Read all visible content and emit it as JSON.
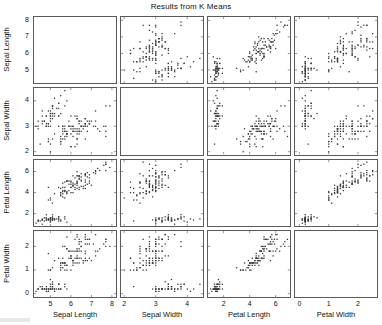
{
  "chart_data": {
    "type": "scatter",
    "title": "Results from K Means",
    "layout": "scatter-plot-matrix",
    "matrix_size": 4,
    "grid": false,
    "legend": "none",
    "diagonal_cells_empty": true,
    "variables": [
      {
        "name": "Sepal Length",
        "axis_label": "Sepal Length",
        "ticks": [
          5,
          6,
          7,
          8
        ],
        "tick_labels": [
          "5",
          "6",
          "7",
          "8"
        ],
        "lim": [
          4.2,
          8.2
        ]
      },
      {
        "name": "Sepal Width",
        "axis_label": "Sepal Width",
        "ticks": [
          2,
          3,
          4
        ],
        "tick_labels": [
          "2",
          "3",
          "4"
        ],
        "lim": [
          1.9,
          4.5
        ]
      },
      {
        "name": "Petal Length",
        "axis_label": "Petal Length",
        "ticks": [
          2,
          4,
          6
        ],
        "tick_labels": [
          "2",
          "4",
          "6"
        ],
        "lim": [
          0.8,
          7.1
        ]
      },
      {
        "name": "Petal Width",
        "axis_label": "Petal Width",
        "ticks": [
          0,
          1,
          2
        ],
        "tick_labels": [
          "0",
          "1",
          "2"
        ],
        "lim": [
          -0.15,
          2.65
        ]
      }
    ],
    "point_color": "#3b3b3b",
    "marker": "dot",
    "n_points": 150,
    "points": [
      [
        5.1,
        3.5,
        1.4,
        0.2
      ],
      [
        4.9,
        3.0,
        1.4,
        0.2
      ],
      [
        4.7,
        3.2,
        1.3,
        0.2
      ],
      [
        4.6,
        3.1,
        1.5,
        0.2
      ],
      [
        5.0,
        3.6,
        1.4,
        0.2
      ],
      [
        5.4,
        3.9,
        1.7,
        0.4
      ],
      [
        4.6,
        3.4,
        1.4,
        0.3
      ],
      [
        5.0,
        3.4,
        1.5,
        0.2
      ],
      [
        4.4,
        2.9,
        1.4,
        0.2
      ],
      [
        4.9,
        3.1,
        1.5,
        0.1
      ],
      [
        5.4,
        3.7,
        1.5,
        0.2
      ],
      [
        4.8,
        3.4,
        1.6,
        0.2
      ],
      [
        4.8,
        3.0,
        1.4,
        0.1
      ],
      [
        4.3,
        3.0,
        1.1,
        0.1
      ],
      [
        5.8,
        4.0,
        1.2,
        0.2
      ],
      [
        5.7,
        4.4,
        1.5,
        0.4
      ],
      [
        5.4,
        3.9,
        1.3,
        0.4
      ],
      [
        5.1,
        3.5,
        1.4,
        0.3
      ],
      [
        5.7,
        3.8,
        1.7,
        0.3
      ],
      [
        5.1,
        3.8,
        1.5,
        0.3
      ],
      [
        5.4,
        3.4,
        1.7,
        0.2
      ],
      [
        5.1,
        3.7,
        1.5,
        0.4
      ],
      [
        4.6,
        3.6,
        1.0,
        0.2
      ],
      [
        5.1,
        3.3,
        1.7,
        0.5
      ],
      [
        4.8,
        3.4,
        1.9,
        0.2
      ],
      [
        5.0,
        3.0,
        1.6,
        0.2
      ],
      [
        5.0,
        3.4,
        1.6,
        0.4
      ],
      [
        5.2,
        3.5,
        1.5,
        0.2
      ],
      [
        5.2,
        3.4,
        1.4,
        0.2
      ],
      [
        4.7,
        3.2,
        1.6,
        0.2
      ],
      [
        4.8,
        3.1,
        1.6,
        0.2
      ],
      [
        5.4,
        3.4,
        1.5,
        0.4
      ],
      [
        5.2,
        4.1,
        1.5,
        0.1
      ],
      [
        5.5,
        4.2,
        1.4,
        0.2
      ],
      [
        4.9,
        3.1,
        1.5,
        0.2
      ],
      [
        5.0,
        3.2,
        1.2,
        0.2
      ],
      [
        5.5,
        3.5,
        1.3,
        0.2
      ],
      [
        4.9,
        3.6,
        1.4,
        0.1
      ],
      [
        4.4,
        3.0,
        1.3,
        0.2
      ],
      [
        5.1,
        3.4,
        1.5,
        0.2
      ],
      [
        5.0,
        3.5,
        1.3,
        0.3
      ],
      [
        4.5,
        2.3,
        1.3,
        0.3
      ],
      [
        4.4,
        3.2,
        1.3,
        0.2
      ],
      [
        5.0,
        3.5,
        1.6,
        0.6
      ],
      [
        5.1,
        3.8,
        1.9,
        0.4
      ],
      [
        4.8,
        3.0,
        1.4,
        0.3
      ],
      [
        5.1,
        3.8,
        1.6,
        0.2
      ],
      [
        4.6,
        3.2,
        1.4,
        0.2
      ],
      [
        5.3,
        3.7,
        1.5,
        0.2
      ],
      [
        5.0,
        3.3,
        1.4,
        0.2
      ],
      [
        7.0,
        3.2,
        4.7,
        1.4
      ],
      [
        6.4,
        3.2,
        4.5,
        1.5
      ],
      [
        6.9,
        3.1,
        4.9,
        1.5
      ],
      [
        5.5,
        2.3,
        4.0,
        1.3
      ],
      [
        6.5,
        2.8,
        4.6,
        1.5
      ],
      [
        5.7,
        2.8,
        4.5,
        1.3
      ],
      [
        6.3,
        3.3,
        4.7,
        1.6
      ],
      [
        4.9,
        2.4,
        3.3,
        1.0
      ],
      [
        6.6,
        2.9,
        4.6,
        1.3
      ],
      [
        5.2,
        2.7,
        3.9,
        1.4
      ],
      [
        5.0,
        2.0,
        3.5,
        1.0
      ],
      [
        5.9,
        3.0,
        4.2,
        1.5
      ],
      [
        6.0,
        2.2,
        4.0,
        1.0
      ],
      [
        6.1,
        2.9,
        4.7,
        1.4
      ],
      [
        5.6,
        2.9,
        3.6,
        1.3
      ],
      [
        6.7,
        3.1,
        4.4,
        1.4
      ],
      [
        5.6,
        3.0,
        4.5,
        1.5
      ],
      [
        5.8,
        2.7,
        4.1,
        1.0
      ],
      [
        6.2,
        2.2,
        4.5,
        1.5
      ],
      [
        5.6,
        2.5,
        3.9,
        1.1
      ],
      [
        5.9,
        3.2,
        4.8,
        1.8
      ],
      [
        6.1,
        2.8,
        4.0,
        1.3
      ],
      [
        6.3,
        2.5,
        4.9,
        1.5
      ],
      [
        6.1,
        2.8,
        4.7,
        1.2
      ],
      [
        6.4,
        2.9,
        4.3,
        1.3
      ],
      [
        6.6,
        3.0,
        4.4,
        1.4
      ],
      [
        6.8,
        2.8,
        4.8,
        1.4
      ],
      [
        6.7,
        3.0,
        5.0,
        1.7
      ],
      [
        6.0,
        2.9,
        4.5,
        1.5
      ],
      [
        5.7,
        2.6,
        3.5,
        1.0
      ],
      [
        5.5,
        2.4,
        3.8,
        1.1
      ],
      [
        5.5,
        2.4,
        3.7,
        1.0
      ],
      [
        5.8,
        2.7,
        3.9,
        1.2
      ],
      [
        6.0,
        2.7,
        5.1,
        1.6
      ],
      [
        5.4,
        3.0,
        4.5,
        1.5
      ],
      [
        6.0,
        3.4,
        4.5,
        1.6
      ],
      [
        6.7,
        3.1,
        4.7,
        1.5
      ],
      [
        6.3,
        2.3,
        4.4,
        1.3
      ],
      [
        5.6,
        3.0,
        4.1,
        1.3
      ],
      [
        5.5,
        2.5,
        4.0,
        1.3
      ],
      [
        5.5,
        2.6,
        4.4,
        1.2
      ],
      [
        6.1,
        3.0,
        4.6,
        1.4
      ],
      [
        5.8,
        2.6,
        4.0,
        1.2
      ],
      [
        5.0,
        2.3,
        3.3,
        1.0
      ],
      [
        5.6,
        2.7,
        4.2,
        1.3
      ],
      [
        5.7,
        3.0,
        4.2,
        1.2
      ],
      [
        5.7,
        2.9,
        4.2,
        1.3
      ],
      [
        6.2,
        2.9,
        4.3,
        1.3
      ],
      [
        5.1,
        2.5,
        3.0,
        1.1
      ],
      [
        5.7,
        2.8,
        4.1,
        1.3
      ],
      [
        6.3,
        3.3,
        6.0,
        2.5
      ],
      [
        5.8,
        2.7,
        5.1,
        1.9
      ],
      [
        7.1,
        3.0,
        5.9,
        2.1
      ],
      [
        6.3,
        2.9,
        5.6,
        1.8
      ],
      [
        6.5,
        3.0,
        5.8,
        2.2
      ],
      [
        7.6,
        3.0,
        6.6,
        2.1
      ],
      [
        4.9,
        2.5,
        4.5,
        1.7
      ],
      [
        7.3,
        2.9,
        6.3,
        1.8
      ],
      [
        6.7,
        2.5,
        5.8,
        1.8
      ],
      [
        7.2,
        3.6,
        6.1,
        2.5
      ],
      [
        6.5,
        3.2,
        5.1,
        2.0
      ],
      [
        6.4,
        2.7,
        5.3,
        1.9
      ],
      [
        6.8,
        3.0,
        5.5,
        2.1
      ],
      [
        5.7,
        2.5,
        5.0,
        2.0
      ],
      [
        5.8,
        2.8,
        5.1,
        2.4
      ],
      [
        6.4,
        3.2,
        5.3,
        2.3
      ],
      [
        6.5,
        3.0,
        5.5,
        1.8
      ],
      [
        7.7,
        3.8,
        6.7,
        2.2
      ],
      [
        7.7,
        2.6,
        6.9,
        2.3
      ],
      [
        6.0,
        2.2,
        5.0,
        1.5
      ],
      [
        6.9,
        3.2,
        5.7,
        2.3
      ],
      [
        5.6,
        2.8,
        4.9,
        2.0
      ],
      [
        7.7,
        2.8,
        6.7,
        2.0
      ],
      [
        6.3,
        2.7,
        4.9,
        1.8
      ],
      [
        6.7,
        3.3,
        5.7,
        2.1
      ],
      [
        7.2,
        3.2,
        6.0,
        1.8
      ],
      [
        6.2,
        2.8,
        4.8,
        1.8
      ],
      [
        6.1,
        3.0,
        4.9,
        1.8
      ],
      [
        6.4,
        2.8,
        5.6,
        2.1
      ],
      [
        7.2,
        3.0,
        5.8,
        1.6
      ],
      [
        7.4,
        2.8,
        6.1,
        1.9
      ],
      [
        7.9,
        3.8,
        6.4,
        2.0
      ],
      [
        6.4,
        2.8,
        5.6,
        2.2
      ],
      [
        6.3,
        2.8,
        5.1,
        1.5
      ],
      [
        6.1,
        2.6,
        5.6,
        1.4
      ],
      [
        7.7,
        3.0,
        6.1,
        2.3
      ],
      [
        6.3,
        3.4,
        5.6,
        2.4
      ],
      [
        6.4,
        3.1,
        5.5,
        1.8
      ],
      [
        6.0,
        3.0,
        4.8,
        1.8
      ],
      [
        6.9,
        3.1,
        5.4,
        2.1
      ],
      [
        6.7,
        3.1,
        5.6,
        2.4
      ],
      [
        6.9,
        3.1,
        5.1,
        2.3
      ],
      [
        5.8,
        2.7,
        5.1,
        1.9
      ],
      [
        6.8,
        3.2,
        5.9,
        2.3
      ],
      [
        6.7,
        3.3,
        5.7,
        2.5
      ],
      [
        6.7,
        3.0,
        5.2,
        2.3
      ],
      [
        6.3,
        2.5,
        5.0,
        1.9
      ],
      [
        6.5,
        3.0,
        5.2,
        2.0
      ],
      [
        6.2,
        3.4,
        5.4,
        2.3
      ],
      [
        5.9,
        3.0,
        5.1,
        1.8
      ]
    ]
  }
}
